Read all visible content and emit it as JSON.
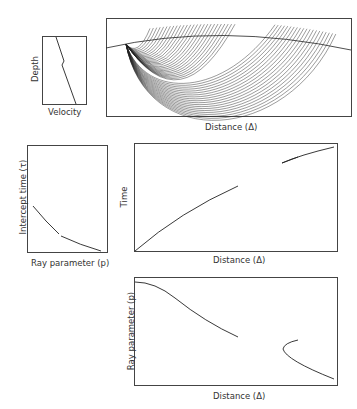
{
  "figure": {
    "panels": {
      "velocity_depth": {
        "xlabel": "Velocity",
        "ylabel": "Depth"
      },
      "ray_paths": {
        "xlabel": "Distance (Δ)"
      },
      "tau_p": {
        "xlabel": "Ray parameter (p)",
        "ylabel": "Intercept time (τ)"
      },
      "travel_time": {
        "xlabel": "Distance (Δ)",
        "ylabel": "Time"
      },
      "p_delta": {
        "xlabel": "Distance (Δ)",
        "ylabel": "Ray parameter (p)"
      }
    }
  },
  "chart_data": [
    {
      "type": "line",
      "title": "Velocity-depth profile",
      "xlabel": "Velocity",
      "ylabel": "Depth",
      "series": [
        {
          "name": "profile",
          "description": "velocity increases with depth, with a small low-velocity kink at mid-depth"
        }
      ],
      "grid": false
    },
    {
      "type": "line",
      "title": "Ray paths",
      "xlabel": "Distance (Δ)",
      "ylabel": "",
      "series": [
        {
          "name": "rays",
          "description": "fan of curved rays from source at left on curved surface; shadow gap between shallow and deep ray families"
        }
      ],
      "grid": false
    },
    {
      "type": "line",
      "title": "τ(p)",
      "xlabel": "Ray parameter (p)",
      "ylabel": "Intercept time (τ)",
      "series": [
        {
          "name": "tau",
          "description": "decreasing concave-up curve with a small break at mid p"
        }
      ],
      "grid": false
    },
    {
      "type": "line",
      "title": "Travel time curve",
      "xlabel": "Distance (Δ)",
      "ylabel": "Time",
      "series": [
        {
          "name": "direct branch",
          "description": "from origin rising to ~mid distance"
        },
        {
          "name": "far branch",
          "description": "short branch with small triplication near right edge"
        }
      ],
      "grid": false
    },
    {
      "type": "line",
      "title": "p(Δ)",
      "xlabel": "Distance (Δ)",
      "ylabel": "Ray parameter (p)",
      "series": [
        {
          "name": "near branch",
          "description": "decreasing from top-left to ~mid distance"
        },
        {
          "name": "far branch",
          "description": "backward-turning hook then decreasing to right edge"
        }
      ],
      "grid": false
    }
  ]
}
